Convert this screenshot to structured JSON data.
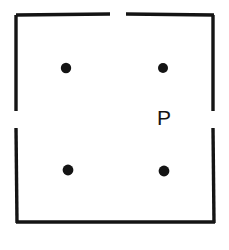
{
  "figure": {
    "background_color": "#ffffff",
    "ink_color": "#141414",
    "canvas": {
      "width": 229,
      "height": 250
    },
    "labels": [
      {
        "name": "point-label-p",
        "text": "P",
        "x": 164,
        "y": 125,
        "font_size": 21
      }
    ],
    "points": [
      {
        "name": "point-top-left",
        "label": "",
        "cx": 66,
        "cy": 68,
        "r": 5.2
      },
      {
        "name": "point-top-right",
        "label": "",
        "cx": 163,
        "cy": 68,
        "r": 5.0
      },
      {
        "name": "point-bottom-left",
        "label": "",
        "cx": 68,
        "cy": 170,
        "r": 5.4
      },
      {
        "name": "point-bottom-right",
        "label": "",
        "cx": 164,
        "cy": 171,
        "r": 5.4
      }
    ],
    "segments": [
      {
        "name": "border-top-left-segment",
        "x1": 16,
        "y1": 15,
        "x2": 110,
        "y2": 14,
        "width": 3.4
      },
      {
        "name": "border-top-right-segment",
        "x1": 126,
        "y1": 14,
        "x2": 214,
        "y2": 15,
        "width": 3.4
      },
      {
        "name": "border-left-upper-segment",
        "x1": 16,
        "y1": 15,
        "x2": 16,
        "y2": 111,
        "width": 3.4
      },
      {
        "name": "border-left-lower-segment",
        "x1": 16,
        "y1": 128,
        "x2": 17,
        "y2": 223,
        "width": 3.4
      },
      {
        "name": "border-right-upper-segment",
        "x1": 213,
        "y1": 15,
        "x2": 213,
        "y2": 111,
        "width": 3.4
      },
      {
        "name": "border-right-lower-segment",
        "x1": 213,
        "y1": 128,
        "x2": 214,
        "y2": 223,
        "width": 3.4
      },
      {
        "name": "border-bottom-segment",
        "x1": 16,
        "y1": 222,
        "x2": 215,
        "y2": 222,
        "width": 3.6
      }
    ],
    "gaps": [
      {
        "name": "gap-top-edge",
        "from": 110,
        "to": 126,
        "axis": "x"
      },
      {
        "name": "gap-left-edge",
        "from": 111,
        "to": 128,
        "axis": "y"
      },
      {
        "name": "gap-right-edge",
        "from": 111,
        "to": 128,
        "axis": "y"
      }
    ]
  }
}
